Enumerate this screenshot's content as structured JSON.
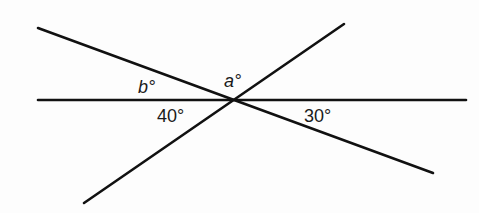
{
  "diagram": {
    "type": "intersecting-lines",
    "intersection": {
      "x": 232,
      "y": 100
    },
    "lines": [
      {
        "id": "horizontal",
        "x1": 38,
        "y1": 100,
        "x2": 466,
        "y2": 100
      },
      {
        "id": "descending",
        "x1": 38,
        "y1": 28,
        "x2": 433,
        "y2": 173
      },
      {
        "id": "ascending",
        "x1": 84,
        "y1": 203,
        "x2": 344,
        "y2": 24
      }
    ],
    "stroke_color": "#111111",
    "stroke_width": 2.6,
    "labels": {
      "b": {
        "text": "b°",
        "x": 138,
        "y": 78,
        "italic": true
      },
      "a": {
        "text": "a°",
        "x": 224,
        "y": 72,
        "italic": true
      },
      "angle_40": {
        "text": "40°",
        "x": 157,
        "y": 107,
        "italic": false
      },
      "angle_30": {
        "text": "30°",
        "x": 304,
        "y": 107,
        "italic": false
      }
    }
  }
}
